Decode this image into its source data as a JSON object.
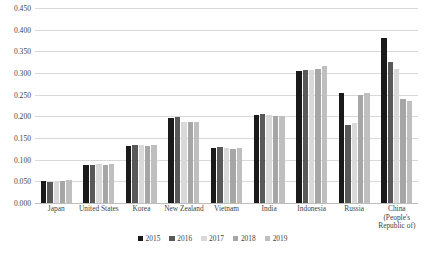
{
  "chart_data": {
    "type": "bar",
    "title": "",
    "xlabel": "",
    "ylabel": "",
    "ylim": [
      0.0,
      0.45
    ],
    "ytick_labels": [
      "0.450",
      "0.400",
      "0.350",
      "0.300",
      "0.250",
      "0.200",
      "0.150",
      "0.100",
      "0.050",
      "0.000"
    ],
    "ytick_values": [
      0.45,
      0.4,
      0.35,
      0.3,
      0.25,
      0.2,
      0.15,
      0.1,
      0.05,
      0.0
    ],
    "grid": true,
    "legend_position": "bottom",
    "categories": [
      "Japan",
      "United States",
      "Korea",
      "New Zealand",
      "Vietnam",
      "India",
      "Indonesia",
      "Russia",
      "China (People's Republic of)"
    ],
    "series": [
      {
        "name": "2015",
        "color": "#1a1a1a",
        "values": [
          0.05,
          0.088,
          0.131,
          0.197,
          0.128,
          0.203,
          0.305,
          0.255,
          0.38
        ]
      },
      {
        "name": "2016",
        "color": "#595959",
        "values": [
          0.049,
          0.088,
          0.133,
          0.199,
          0.13,
          0.205,
          0.307,
          0.18,
          0.325
        ]
      },
      {
        "name": "2017",
        "color": "#d9d9d9",
        "values": [
          0.051,
          0.089,
          0.133,
          0.187,
          0.127,
          0.202,
          0.308,
          0.185,
          0.31
        ]
      },
      {
        "name": "2018",
        "color": "#a6a6a6",
        "values": [
          0.05,
          0.088,
          0.132,
          0.186,
          0.125,
          0.2,
          0.31,
          0.25,
          0.24
        ]
      },
      {
        "name": "2019",
        "color": "#bfbfbf",
        "values": [
          0.052,
          0.09,
          0.133,
          0.186,
          0.126,
          0.2,
          0.317,
          0.255,
          0.235
        ]
      }
    ]
  }
}
